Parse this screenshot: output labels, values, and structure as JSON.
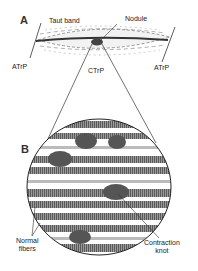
{
  "panels": {
    "a": {
      "letter": "A",
      "labels": {
        "taut_band": "Taut band",
        "nodule": "Nodule",
        "atrp_left": "ATrP",
        "ctrp": "CTrP",
        "atrp_right": "ATrP"
      }
    },
    "b": {
      "letter": "B",
      "labels": {
        "normal_fibers_line1": "Normal",
        "normal_fibers_line2": "fibers",
        "contraction_knot_line1": "Contraction",
        "contraction_knot_line2": "knot"
      }
    }
  },
  "colors": {
    "ink": "#222222",
    "fiber_dark": "#6a6a6a",
    "fiber_light": "#d8d8d8",
    "background": "#ffffff"
  }
}
